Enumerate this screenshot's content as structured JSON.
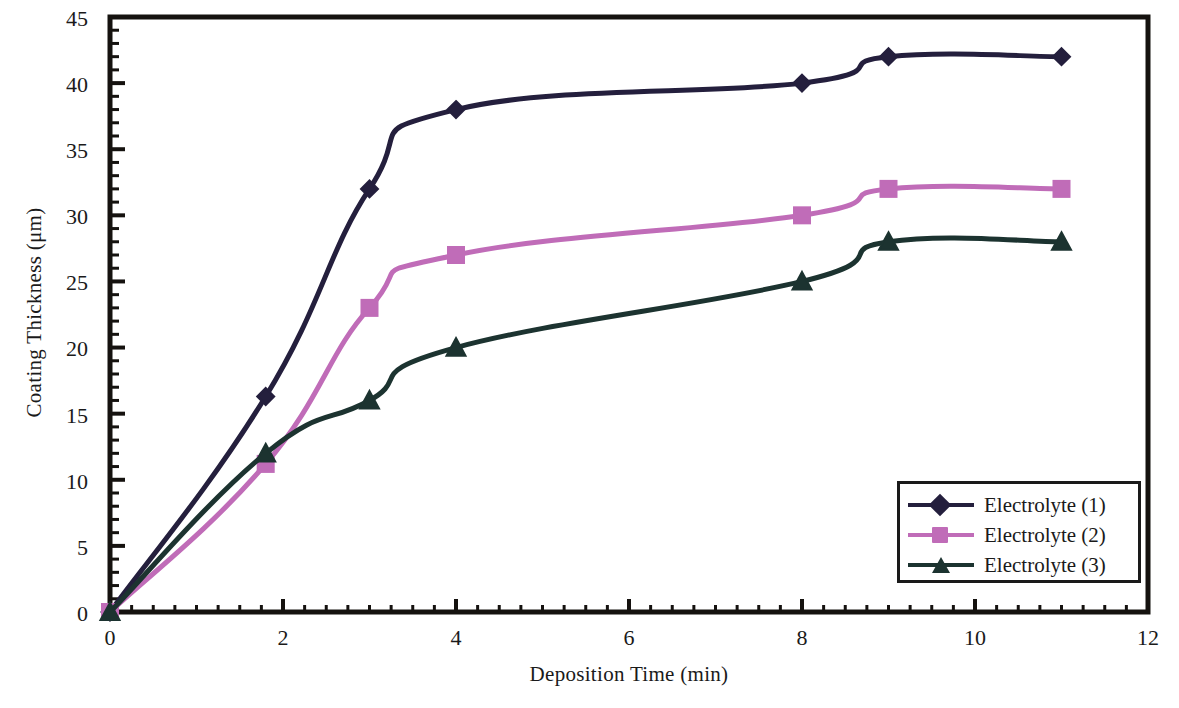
{
  "chart_data": {
    "type": "line",
    "title": "",
    "xlabel": "Deposition Time (min)",
    "ylabel": "Coating Thickness (μm)",
    "xlim": [
      0,
      12
    ],
    "ylim": [
      0,
      45
    ],
    "xticks": [
      "0",
      "2",
      "4",
      "6",
      "8",
      "10",
      "12"
    ],
    "yticks": [
      "0",
      "5",
      "10",
      "15",
      "20",
      "25",
      "30",
      "35",
      "40",
      "45"
    ],
    "x_minor_tick_step": 0.25,
    "y_minor_tick_step": 1,
    "grid": false,
    "legend_position": "lower-right",
    "series": [
      {
        "name": "Electrolyte (1)",
        "color": "#241f3d",
        "marker": "diamond",
        "x": [
          0,
          1.8,
          3,
          4,
          8,
          9,
          11
        ],
        "values": [
          0,
          16.3,
          32,
          38,
          40,
          42,
          42
        ]
      },
      {
        "name": "Electrolyte (2)",
        "color": "#c06cb8",
        "marker": "square",
        "x": [
          0,
          1.8,
          3,
          4,
          8,
          9,
          11
        ],
        "values": [
          0,
          11.2,
          23,
          27,
          30,
          32,
          32
        ]
      },
      {
        "name": "Electrolyte (3)",
        "color": "#1c3330",
        "marker": "triangle",
        "x": [
          0,
          1.8,
          3,
          4,
          8,
          9,
          11
        ],
        "values": [
          0,
          12,
          16,
          20,
          25,
          28,
          28
        ]
      }
    ]
  },
  "axes": {
    "y_label": "Coating Thickness (μm)",
    "x_label": "Deposition Time (min)",
    "y_tick_0": "0",
    "y_tick_1": "5",
    "y_tick_2": "10",
    "y_tick_3": "15",
    "y_tick_4": "20",
    "y_tick_5": "25",
    "y_tick_6": "30",
    "y_tick_7": "35",
    "y_tick_8": "40",
    "y_tick_9": "45",
    "x_tick_0": "0",
    "x_tick_1": "2",
    "x_tick_2": "4",
    "x_tick_3": "6",
    "x_tick_4": "8",
    "x_tick_5": "10",
    "x_tick_6": "12"
  },
  "legend": {
    "entries": [
      {
        "label": "Electrolyte (1)",
        "color": "#241f3d"
      },
      {
        "label": "Electrolyte (2)",
        "color": "#c06cb8"
      },
      {
        "label": "Electrolyte (3)",
        "color": "#1c3330"
      }
    ]
  }
}
